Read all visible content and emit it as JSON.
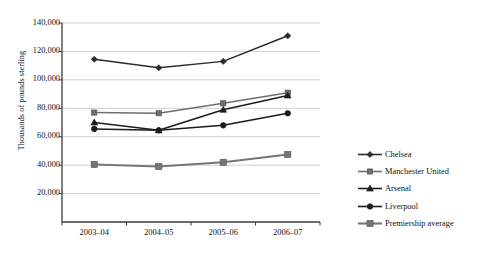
{
  "chart_data": {
    "type": "line",
    "title": "",
    "xlabel": "",
    "ylabel": "Thousands of pounds sterling",
    "categories": [
      "2003–04",
      "2004–05",
      "2005–06",
      "2006–07"
    ],
    "ylim": [
      0,
      140000
    ],
    "ytick_step": 20000,
    "ytick_labels": [
      "20,000",
      "40,000",
      "60,000",
      "80,000",
      "100,000",
      "120,000",
      "140,000"
    ],
    "ytick_values": [
      20000,
      40000,
      60000,
      80000,
      100000,
      120000,
      140000
    ],
    "grid": "horizontal",
    "legend_position": "right",
    "series": [
      {
        "name": "Chelsea",
        "marker": "diamond",
        "color": "#2b2b2b",
        "values": [
          114500,
          108500,
          113000,
          131000
        ]
      },
      {
        "name": "Manchester United",
        "marker": "square",
        "color": "#6f6f6f",
        "values": [
          77000,
          76500,
          83500,
          91000
        ]
      },
      {
        "name": "Arsenal",
        "marker": "triangle",
        "color": "#1c1c1c",
        "values": [
          70000,
          64500,
          79000,
          89000
        ]
      },
      {
        "name": "Liverpool",
        "marker": "circle",
        "color": "#1c1c1c",
        "values": [
          65500,
          64500,
          68000,
          76500
        ]
      },
      {
        "name": "Premiership average",
        "marker": "square-large",
        "color": "#767676",
        "values": [
          40500,
          39000,
          42000,
          47500
        ]
      }
    ]
  },
  "colors": {
    "axis": "#3a3a3a",
    "grid": "#c9c9c9",
    "text": "#111111",
    "background": "#ffffff"
  }
}
